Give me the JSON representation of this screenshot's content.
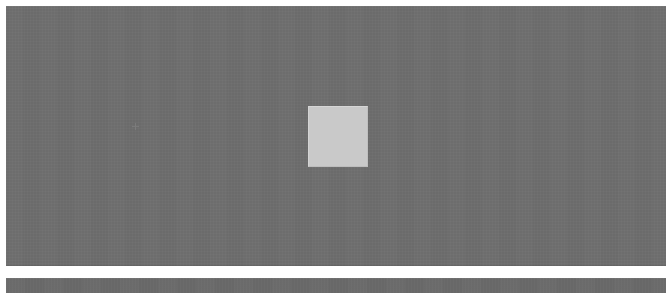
{
  "page": {
    "width": 671,
    "height": 293,
    "background_color": "#ffffff"
  },
  "primary_panel": {
    "name": "Primary viewport",
    "label": "",
    "x": 6,
    "y": 6,
    "width": 660,
    "height": 260,
    "fill_color": "#6e6e6e",
    "description": "Large uniform gray viewport area with no visible text or controls"
  },
  "content_placeholder": {
    "name": "Content placeholder square",
    "label": "",
    "x": 308,
    "y": 106,
    "width": 60,
    "height": 61,
    "fill_color": "#c9c9c9",
    "border_color": "#d4d4d4",
    "description": "Light gray square centered horizontally in the upper-middle of the viewport"
  },
  "pointer_marker": {
    "name": "Pointer artifact",
    "label": "",
    "x": 132,
    "y": 123,
    "size": 7,
    "color": "#9a9a9a",
    "opacity": 0.3
  },
  "panel_gap": {
    "name": "Separator gap",
    "y": 266,
    "height": 12,
    "fill_color": "#ffffff"
  },
  "secondary_panel": {
    "name": "Secondary viewport (clipped)",
    "label": "",
    "x": 6,
    "y": 278,
    "width": 660,
    "height": 15,
    "fill_color": "#6a6a6a",
    "description": "Top sliver of a second gray panel, cropped by the bottom edge of the capture"
  }
}
